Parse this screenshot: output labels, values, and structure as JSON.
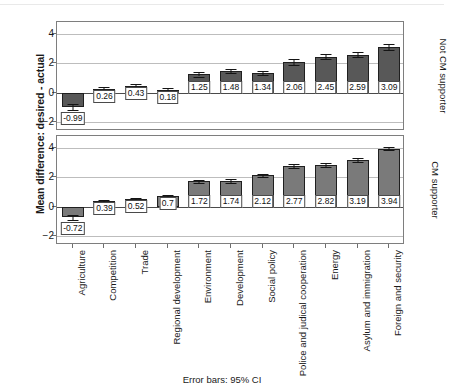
{
  "figure": {
    "ylabel": "Mean difference: desired - actual",
    "footnote": "Error bars: 95% CI",
    "yticks": [
      "4",
      "2",
      "0",
      "-2"
    ],
    "panel_labels": {
      "top": "Not CM supporter",
      "bottom": "CM supporter"
    },
    "colors": {
      "bar_top": "#585858",
      "bar_bottom": "#7a7a7a",
      "bar_outline": "#1f1f1f",
      "grid": "#bdbdbd",
      "frame": "#7e7e7e",
      "text": "#1a1a1a"
    }
  },
  "chart_data": {
    "type": "bar",
    "title": "",
    "xlabel": "",
    "ylabel": "Mean difference: desired - actual",
    "ylim": [
      -2.6,
      4.8
    ],
    "yticks": [
      4,
      2,
      0,
      -2
    ],
    "grid": true,
    "legend": "none",
    "error_bars": "95% CI",
    "facets": [
      "Not CM supporter",
      "CM supporter"
    ],
    "categories": [
      "Agriculture",
      "Competition",
      "Trade",
      "Regional development",
      "Environment",
      "Development",
      "Social policy",
      "Police and judical cooperation",
      "Energy",
      "Asylum and immigration",
      "Foreign and security"
    ],
    "series": [
      {
        "name": "Not CM supporter",
        "values": [
          -0.99,
          0.26,
          0.43,
          0.18,
          1.25,
          1.48,
          1.34,
          2.06,
          2.45,
          2.59,
          3.09
        ],
        "labels": [
          "-0.99",
          "0.26",
          "0.43",
          "0.18",
          "1.25",
          "1.48",
          "1.34",
          "2.06",
          "2.45",
          "2.59",
          "3.09"
        ],
        "ci_low": [
          -1.19,
          0.16,
          0.3,
          0.06,
          1.1,
          1.33,
          1.18,
          1.86,
          2.27,
          2.39,
          2.88
        ],
        "ci_high": [
          -0.79,
          0.36,
          0.56,
          0.3,
          1.4,
          1.63,
          1.5,
          2.26,
          2.63,
          2.79,
          3.3
        ]
      },
      {
        "name": "CM supporter",
        "values": [
          -0.72,
          0.39,
          0.52,
          0.7,
          1.72,
          1.74,
          2.12,
          2.77,
          2.82,
          3.19,
          3.94
        ],
        "labels": [
          "-0.72",
          "0.39",
          "0.52",
          "0.7",
          "1.72",
          "1.74",
          "2.12",
          "2.77",
          "2.82",
          "3.19",
          "3.94"
        ],
        "ci_low": [
          -0.87,
          0.31,
          0.44,
          0.6,
          1.62,
          1.63,
          2.0,
          2.65,
          2.7,
          3.06,
          3.82
        ],
        "ci_high": [
          -0.57,
          0.47,
          0.6,
          0.8,
          1.82,
          1.85,
          2.24,
          2.89,
          2.94,
          3.32,
          4.06
        ]
      }
    ]
  }
}
